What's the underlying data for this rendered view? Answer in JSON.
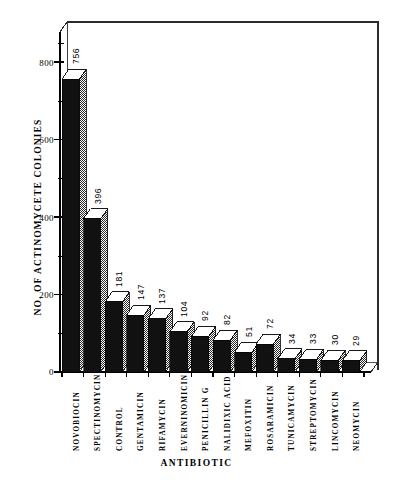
{
  "chart_data": {
    "type": "bar",
    "title": "",
    "subtitle": "",
    "xlabel": "ANTIBIOTIC",
    "ylabel": "NO. OF ACTINOMYCETE COLONIES",
    "categories": [
      "NOVOBIOCIN",
      "SPECTINOMYCIN",
      "CONTROL",
      "GENTAMICIN",
      "RIFAMYCIN",
      "EVERNINOMICIN",
      "PENICILLIN G",
      "NALIDIXIC ACID",
      "MEFOXITIN",
      "ROSARAMICIN",
      "TUNICAMYCIN",
      "STREPTOMYCIN",
      "LINCOMYCIN",
      "NEOMYCIN"
    ],
    "values": [
      756,
      396,
      181,
      147,
      137,
      104,
      92,
      82,
      51,
      72,
      34,
      33,
      30,
      29
    ],
    "value_labels": [
      "756",
      "396",
      "181",
      "147",
      "137",
      "104",
      "92",
      "82",
      "51",
      "72",
      "34",
      "33",
      "30",
      "29"
    ],
    "ylim": [
      0,
      900
    ],
    "ytick_labels": [
      "0",
      "200",
      "400",
      "600",
      "800"
    ],
    "ytick_values": [
      0,
      200,
      400,
      600,
      800
    ],
    "yminor_values": [
      100,
      300,
      500,
      700,
      900
    ],
    "grid": false,
    "legend": null,
    "style": "3d-bar",
    "colors": {
      "bar_front": "#111111",
      "bar_side": "#8d8d8d",
      "bar_top": "#ffffff",
      "axis": "#000000",
      "background": "#ffffff"
    }
  }
}
